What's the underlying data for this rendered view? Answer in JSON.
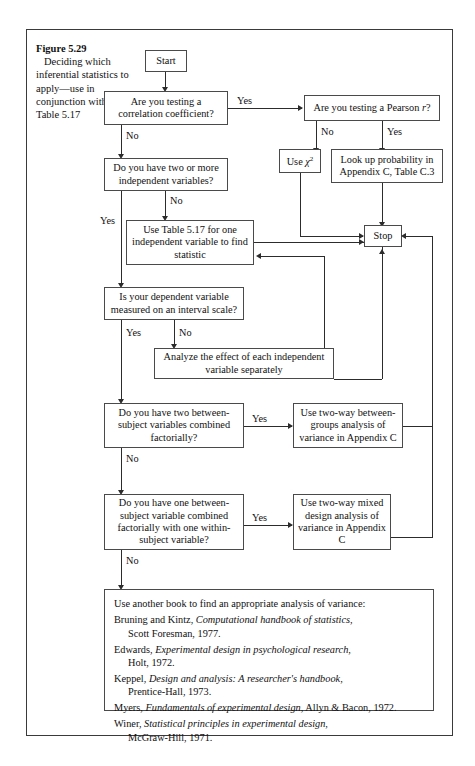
{
  "figure": {
    "number": "Figure 5.29",
    "description": "Deciding which inferential statistics to apply—use in conjunction with Table 5.17"
  },
  "nodes": {
    "start": "Start",
    "q_correlation": "Are you testing a correlation coefficient?",
    "q_pearson": "Are you testing a Pearson r?",
    "use_chi": "Use χ²",
    "lookup": "Look up probability in Appendix C, Table C.3",
    "q_two_iv": "Do you have two or more independent variables?",
    "use_table517": "Use Table 5.17 for one independent variable to find statistic",
    "stop": "Stop",
    "q_interval": "Is your dependent variable measured on an interval scale?",
    "analyze_sep": "Analyze the effect of each independent variable separately",
    "q_two_between": "Do you have two between-subject variables combined factorially?",
    "two_way_between": "Use two-way between-groups analysis of variance in Appendix C",
    "q_one_between": "Do you have one between-subject variable combined factorially with one within-subject variable?",
    "two_way_mixed": "Use two-way mixed design analysis of variance in Appendix C"
  },
  "edge_labels": {
    "yes": "Yes",
    "no": "No"
  },
  "references": {
    "lead": "Use another book to find an appropriate analysis of variance:",
    "items": [
      {
        "author": "Bruning and Kintz,",
        "title": "Computational handbook of statistics,",
        "publisher": "Scott Foresman, 1977."
      },
      {
        "author": "Edwards,",
        "title": "Experimental design in psychological research,",
        "publisher": "Holt, 1972."
      },
      {
        "author": "Keppel,",
        "title": "Design and analysis: A researcher's handbook,",
        "publisher": "Prentice-Hall, 1973."
      },
      {
        "author": "Myers,",
        "title": "Fundamentals of experimental design,",
        "publisher": "Allyn & Bacon, 1972."
      },
      {
        "author": "Winer,",
        "title": "Statistical principles in experimental design,",
        "publisher": "McGraw-Hill, 1971."
      }
    ]
  },
  "colors": {
    "frame": "#3a3a3a",
    "box_border": "#4a4a4a",
    "line": "#2c2c2c",
    "text": "#111111",
    "background": "#ffffff"
  }
}
